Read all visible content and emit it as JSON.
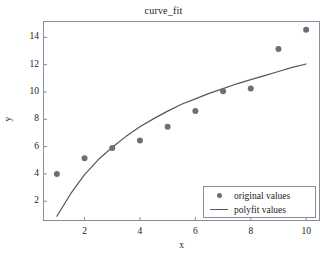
{
  "chart_data": {
    "type": "scatter",
    "title": "curve_fit",
    "xlabel": "x",
    "ylabel": "y",
    "xlim": [
      0.5,
      10.5
    ],
    "ylim": [
      0.55,
      15.2
    ],
    "xticks": [
      2,
      4,
      6,
      8,
      10
    ],
    "yticks": [
      2,
      4,
      6,
      8,
      10,
      12,
      14
    ],
    "xtick_labels": [
      "2",
      "4",
      "6",
      "8",
      "10"
    ],
    "ytick_labels": [
      "2",
      "4",
      "6",
      "8",
      "10",
      "12",
      "14"
    ],
    "grid": false,
    "legend_position": "lower right",
    "marker_color": "#6e6e78",
    "line_color": "#555560",
    "frame_color": "#8a8a99",
    "series": [
      {
        "name": "original values",
        "type": "scatter",
        "x": [
          1,
          2,
          3,
          4,
          5,
          6,
          7,
          8,
          9,
          10
        ],
        "values": [
          4.0,
          5.15,
          5.9,
          6.45,
          7.45,
          8.6,
          10.05,
          10.25,
          13.15,
          14.55
        ]
      },
      {
        "name": "polyfit values",
        "type": "line",
        "x": [
          1,
          1.5,
          2,
          2.5,
          3,
          3.5,
          4,
          4.5,
          5,
          5.5,
          6,
          6.5,
          7,
          7.5,
          8,
          8.5,
          9,
          9.5,
          10
        ],
        "values": [
          0.9,
          2.55,
          3.95,
          5.05,
          5.95,
          6.75,
          7.45,
          8.05,
          8.6,
          9.1,
          9.5,
          9.9,
          10.25,
          10.6,
          10.9,
          11.2,
          11.5,
          11.8,
          12.05
        ]
      }
    ]
  },
  "legend": {
    "entries": [
      {
        "label": "original values",
        "symbol": "marker-dot"
      },
      {
        "label": "polyfit values",
        "symbol": "line-segment"
      }
    ]
  }
}
